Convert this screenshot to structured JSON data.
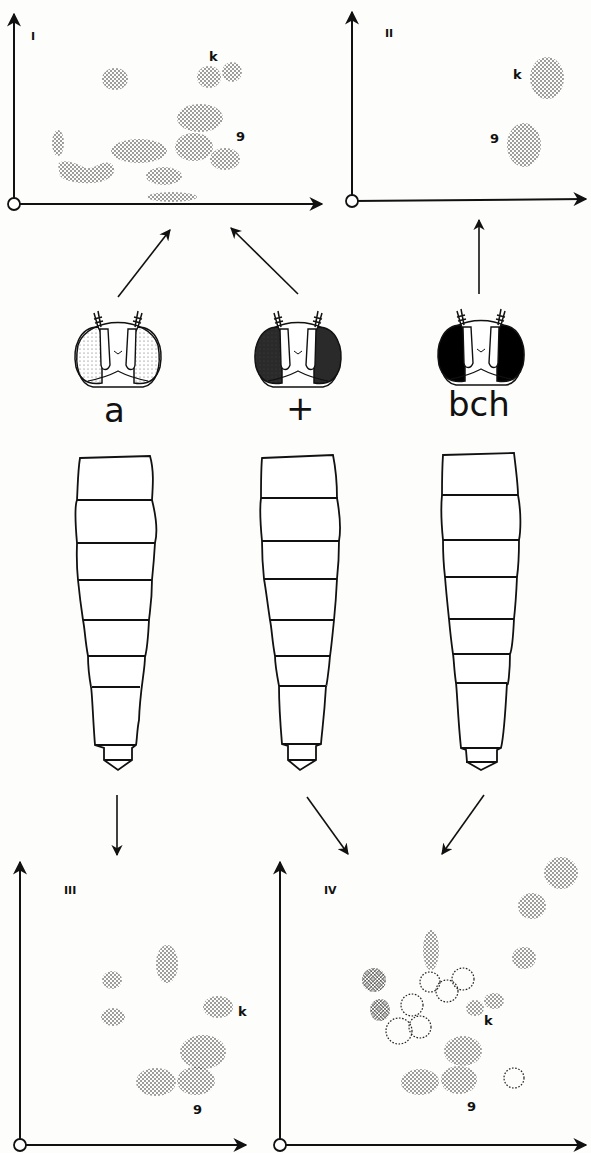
{
  "figure": {
    "panels": [
      {
        "id": "I",
        "label": "I",
        "spot_labels": {
          "k": "k",
          "g": "9"
        }
      },
      {
        "id": "II",
        "label": "II",
        "spot_labels": {
          "k": "k",
          "g": "9"
        }
      },
      {
        "id": "III",
        "label": "III",
        "spot_labels": {
          "k": "k",
          "g": "9"
        }
      },
      {
        "id": "IV",
        "label": "IV",
        "spot_labels": {
          "k": "k",
          "g": "9"
        }
      }
    ],
    "genotypes": [
      {
        "label": "a",
        "eye_shading": "light-stippled",
        "eye_color": "#d8d8d8"
      },
      {
        "label": "+",
        "eye_shading": "dark-stippled",
        "eye_color": "#333333"
      },
      {
        "label": "bch",
        "eye_shading": "solid-black",
        "eye_color": "#000000"
      }
    ],
    "arrows": [
      {
        "from": "a-head",
        "to": "panel-I"
      },
      {
        "from": "+-head",
        "to": "panel-I"
      },
      {
        "from": "bch-head",
        "to": "panel-II"
      },
      {
        "from": "a-abdomen",
        "to": "panel-III"
      },
      {
        "from": "+-abdomen",
        "to": "panel-IV"
      },
      {
        "from": "bch-abdomen",
        "to": "panel-IV"
      }
    ]
  }
}
